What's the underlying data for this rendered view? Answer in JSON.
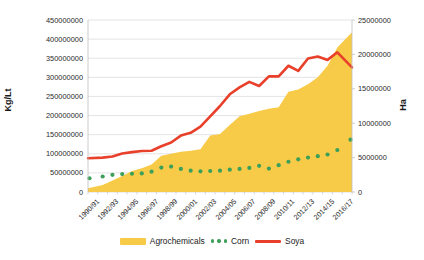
{
  "chart_data": {
    "type": "area",
    "title": "",
    "xlabel": "",
    "ylabel": "Kg/Lt",
    "ylabel_right": "Ha",
    "grid": true,
    "legend_position": "bottom",
    "ylim": [
      0,
      450000000
    ],
    "ylim_right": [
      0,
      25000000
    ],
    "yticks": [
      "0",
      "50000000",
      "100000000",
      "150000000",
      "200000000",
      "250000000",
      "300000000",
      "350000000",
      "400000000",
      "450000000"
    ],
    "yticks_right": [
      "0",
      "5000000",
      "10000000",
      "15000000",
      "20000000",
      "25000000"
    ],
    "categories": [
      "1990/91",
      "1991/92",
      "1992/93",
      "1993/94",
      "1994/95",
      "1995/96",
      "1996/97",
      "1997/98",
      "1998/99",
      "1999/00",
      "2000/01",
      "2001/02",
      "2002/03",
      "2003/04",
      "2004/05",
      "2005/06",
      "2006/07",
      "2007/08",
      "2008/09",
      "2009/10",
      "2010/11",
      "2011/12",
      "2012/13",
      "2013/14",
      "2014/15",
      "2015/16",
      "2016/17"
    ],
    "xticks_shown": [
      "1990/91",
      "1992/93",
      "1994/95",
      "1996/97",
      "1998/99",
      "2000/01",
      "2002/03",
      "2004/05",
      "2006/07",
      "2008/09",
      "2010/11",
      "2012/13",
      "2014/15",
      "2016/17"
    ],
    "series": [
      {
        "name": "Agrochemicals",
        "type": "area",
        "axis": "left",
        "color": "#F7CB47",
        "values": [
          10000000,
          18000000,
          30000000,
          42000000,
          55000000,
          62000000,
          72000000,
          95000000,
          100000000,
          105000000,
          108000000,
          112000000,
          148000000,
          152000000,
          175000000,
          198000000,
          205000000,
          212000000,
          218000000,
          222000000,
          262000000,
          268000000,
          282000000,
          300000000,
          330000000,
          378000000,
          418000000
        ]
      },
      {
        "name": "Corn",
        "type": "scatter",
        "axis": "right",
        "color": "#3DA05A",
        "values": [
          2000000,
          2250000,
          2500000,
          2600000,
          2650000,
          2700000,
          2950000,
          3550000,
          3700000,
          3350000,
          3100000,
          3000000,
          3050000,
          3100000,
          3250000,
          3350000,
          3500000,
          3800000,
          3400000,
          3900000,
          4400000,
          4750000,
          5000000,
          5200000,
          5450000,
          6100000,
          7600000
        ]
      },
      {
        "name": "Soya",
        "type": "line",
        "axis": "right",
        "color": "#E8402A",
        "values": [
          4900000,
          5000000,
          5150000,
          5600000,
          5800000,
          5950000,
          6000000,
          6650000,
          7200000,
          8200000,
          8600000,
          9500000,
          11000000,
          12500000,
          14200000,
          15200000,
          16000000,
          15400000,
          16800000,
          16800000,
          18350000,
          17600000,
          19400000,
          19700000,
          19200000,
          20300000,
          18100000
        ]
      }
    ],
    "legend": [
      {
        "label": "Agrochemicals",
        "marker": "area",
        "color": "#F7CB47"
      },
      {
        "label": "Corn",
        "marker": "dots",
        "color": "#3DA05A"
      },
      {
        "label": "Soya",
        "marker": "line",
        "color": "#E8402A"
      }
    ]
  },
  "plot": {
    "left": 88,
    "top": 20,
    "width": 264,
    "height": 172,
    "grid_color": "#d9d9d9",
    "axis_color": "#bfbfbf",
    "bg": "#ffffff"
  }
}
